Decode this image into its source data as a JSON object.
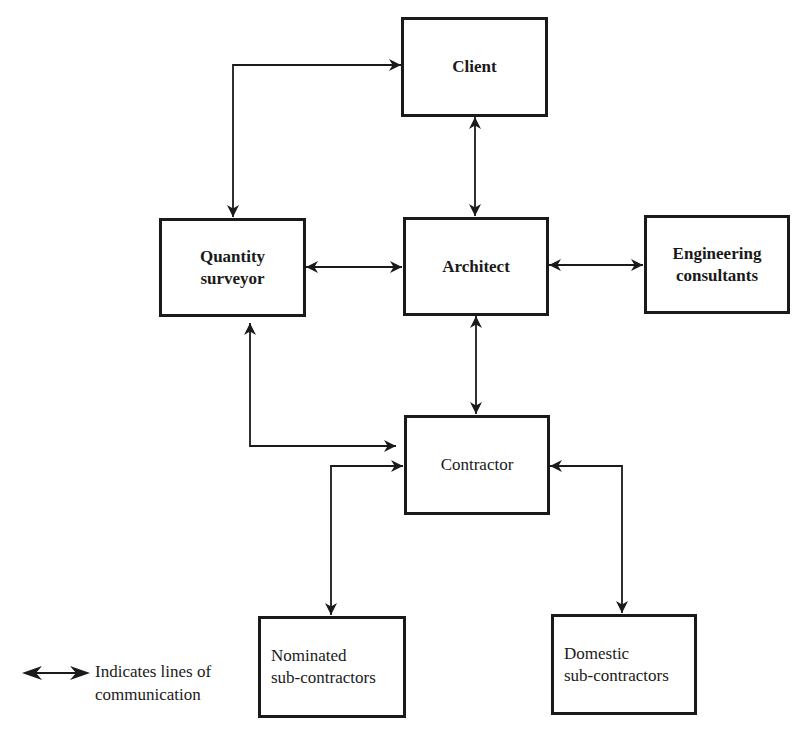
{
  "diagram": {
    "nodes": [
      {
        "id": "client",
        "label": "Client",
        "bold": true
      },
      {
        "id": "quantity_surveyor",
        "label": "Quantity\nsurveyor",
        "bold": true
      },
      {
        "id": "architect",
        "label": "Architect",
        "bold": true
      },
      {
        "id": "engineering_consultants",
        "label": "Engineering\nconsultants",
        "bold": true
      },
      {
        "id": "contractor",
        "label": "Contractor",
        "bold": false
      },
      {
        "id": "nominated_sub_contractors",
        "label": "Nominated\nsub-contractors",
        "bold": false
      },
      {
        "id": "domestic_sub_contractors",
        "label": "Domestic\nsub-contractors",
        "bold": false
      }
    ],
    "edges": [
      {
        "from": "quantity_surveyor",
        "to": "client",
        "type": "bidirectional"
      },
      {
        "from": "client",
        "to": "architect",
        "type": "bidirectional"
      },
      {
        "from": "quantity_surveyor",
        "to": "architect",
        "type": "bidirectional"
      },
      {
        "from": "architect",
        "to": "engineering_consultants",
        "type": "bidirectional"
      },
      {
        "from": "architect",
        "to": "contractor",
        "type": "bidirectional"
      },
      {
        "from": "quantity_surveyor",
        "to": "contractor",
        "type": "bidirectional"
      },
      {
        "from": "contractor",
        "to": "nominated_sub_contractors",
        "type": "bidirectional"
      },
      {
        "from": "contractor",
        "to": "domestic_sub_contractors",
        "type": "bidirectional"
      }
    ]
  },
  "legend": {
    "icon": "double-headed-arrow",
    "text": "Indicates lines of\ncommunication"
  }
}
